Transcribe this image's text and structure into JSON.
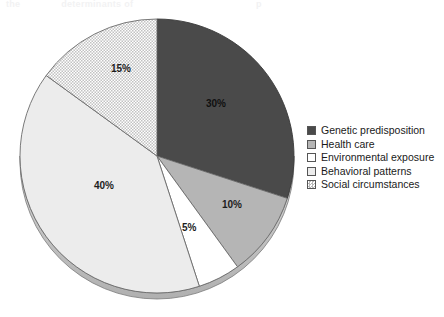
{
  "top_clipped_text": {
    "fragment_a": "the",
    "fragment_b": "determinants of",
    "fragment_c": "p"
  },
  "chart_data": {
    "type": "pie",
    "title": "",
    "legend_position": "right",
    "start_angle_deg": 0,
    "direction": "clockwise",
    "categories": [
      "Genetic predisposition",
      "Health care",
      "Environmental exposure",
      "Behavioral patterns",
      "Social circumstances"
    ],
    "values": [
      30,
      10,
      5,
      40,
      15
    ],
    "value_labels": [
      "30%",
      "10%",
      "5%",
      "40%",
      "15%"
    ],
    "unit": "%",
    "slices": [
      {
        "label": "Genetic predisposition",
        "value": 30,
        "value_label": "30%",
        "color": "#4a4a4a",
        "fill_style": "solid",
        "stroke": "#3a3a3a",
        "label_x": 206,
        "label_y": 98
      },
      {
        "label": "Health care",
        "value": 10,
        "value_label": "10%",
        "color": "#b5b5b5",
        "fill_style": "solid",
        "stroke": "#6b6b6b",
        "label_x": 222,
        "label_y": 199
      },
      {
        "label": "Environmental exposure",
        "value": 5,
        "value_label": "5%",
        "color": "#ffffff",
        "fill_style": "solid",
        "stroke": "#6b6b6b",
        "label_x": 182,
        "label_y": 222
      },
      {
        "label": "Behavioral patterns",
        "value": 40,
        "value_label": "40%",
        "color": "#ececec",
        "fill_style": "solid",
        "stroke": "#6b6b6b",
        "label_x": 94,
        "label_y": 180
      },
      {
        "label": "Social circumstances",
        "value": 15,
        "value_label": "15%",
        "color": "#f0f0f0",
        "fill_style": "dotted-pattern",
        "stroke": "#6b6b6b",
        "label_x": 111,
        "label_y": 63
      }
    ],
    "geometry": {
      "center_x": 157,
      "center_y": 156,
      "radius": 137,
      "rim_depth": 6,
      "rim_color": "#c9c9c9"
    }
  },
  "legend": {
    "items": [
      {
        "label": "Genetic predisposition",
        "color": "#4a4a4a",
        "fill_style": "solid"
      },
      {
        "label": "Health care",
        "color": "#b5b5b5",
        "fill_style": "solid"
      },
      {
        "label": "Environmental exposure",
        "color": "#ffffff",
        "fill_style": "solid"
      },
      {
        "label": "Behavioral patterns",
        "color": "#ececec",
        "fill_style": "solid"
      },
      {
        "label": "Social circumstances",
        "color": "#f0f0f0",
        "fill_style": "dotted-pattern"
      }
    ]
  }
}
